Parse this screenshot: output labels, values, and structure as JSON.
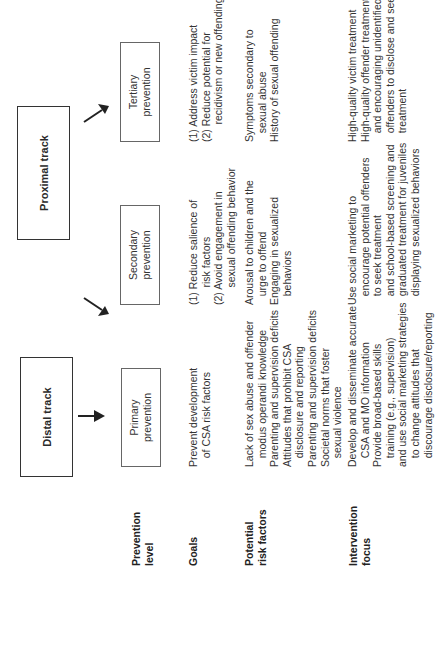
{
  "tracks": {
    "distal": "Distal track",
    "proximal": "Proximal track"
  },
  "row_labels": {
    "prevention_level": "Prevention\nlevel",
    "goals": "Goals",
    "risk_factors": "Potential\nrisk factors",
    "intervention_focus": "Intervention\nfocus"
  },
  "levels": {
    "primary": {
      "label": "Primary\nprevention",
      "goals": "Prevent development\n   of CSA risk factors",
      "risk_factors": "Lack of sex abuse and offender\n   modus operandi knowledge\nParenting and supervision deficits\nAttitudes that prohibit CSA\n   disclosure and reporting\nParenting and supervision deficits\nSocietal norms that foster\n   sexual violence",
      "intervention": "Develop and disseminate accurate\n   CSA and MO information\nProvide broad-based skills\n   training (e.g., supervision)\nand use social marketing strategies\n   to change attitudes that\n   discourage disclosure/reporting"
    },
    "secondary": {
      "label": "Secondary\nprevention",
      "goals": "(1) Reduce salience of\n      risk factors\n(2) Avoid engagement in\n      sexual offending behavior",
      "risk_factors": "Arousal to children and the\n   urge to offend\nEngaging in sexualized\n   behaviors",
      "intervention": "Use social marketing to\n   encourage potential offenders\n   to seek treatment\n   and school-based screening and\n   graduated treatment for juveniles\n   displaying sexualized behaviors"
    },
    "tertiary": {
      "label": "Tertiary\nprevention",
      "goals": "(1) Address victim impact\n(2) Reduce potential for\n      recidivism or new offending",
      "risk_factors": "Symptoms secondary to\n   sexual abuse\nHistory of sexual offending",
      "intervention": "High-quality victim treatment\nHigh-quality offender treatment\n   and encouraging unidentified\n   offenders to disclose and seek\n   treatment"
    }
  },
  "colors": {
    "text": "#2b2b2b",
    "box_border": "#333333",
    "arrow": "#222222"
  }
}
